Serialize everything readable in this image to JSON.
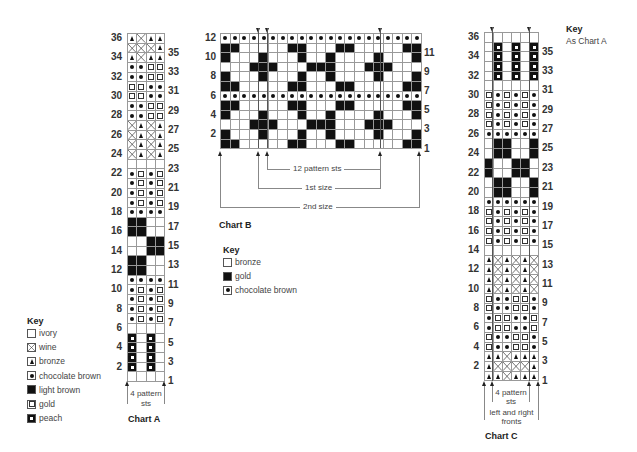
{
  "chart_a": {
    "title": "Chart A",
    "repeat_label": "4 pattern sts",
    "cols": 4,
    "rows_top_to_bottom": [
      [
        "T",
        "X",
        "T",
        "T"
      ],
      [
        "X",
        "X",
        "X",
        "T"
      ],
      [
        "T",
        "X",
        "T",
        "T"
      ],
      [
        "D",
        "D",
        "G",
        "G"
      ],
      [
        "D",
        "D",
        "G",
        "G"
      ],
      [
        "G",
        "G",
        "D",
        "D"
      ],
      [
        "G",
        "G",
        "D",
        "D"
      ],
      [
        "D",
        "D",
        "G",
        "G"
      ],
      [
        "D",
        "D",
        "G",
        "G"
      ],
      [
        "X",
        "T",
        "X",
        "T"
      ],
      [
        "X",
        "T",
        "X",
        "T"
      ],
      [
        "X",
        "T",
        "X",
        "T"
      ],
      [
        "X",
        "T",
        "X",
        "T"
      ],
      [
        "E",
        "E",
        "E",
        "E"
      ],
      [
        "D",
        "G",
        "D",
        "G"
      ],
      [
        "D",
        "G",
        "D",
        "G"
      ],
      [
        "D",
        "G",
        "D",
        "G"
      ],
      [
        "D",
        "G",
        "D",
        "G"
      ],
      [
        "D",
        "D",
        "D",
        "D"
      ],
      [
        "B",
        "B",
        "E",
        "E"
      ],
      [
        "B",
        "B",
        "E",
        "E"
      ],
      [
        "E",
        "E",
        "B",
        "B"
      ],
      [
        "E",
        "E",
        "B",
        "B"
      ],
      [
        "B",
        "B",
        "E",
        "E"
      ],
      [
        "B",
        "B",
        "E",
        "E"
      ],
      [
        "D",
        "D",
        "D",
        "D"
      ],
      [
        "D",
        "G",
        "D",
        "G"
      ],
      [
        "D",
        "G",
        "D",
        "G"
      ],
      [
        "D",
        "G",
        "D",
        "G"
      ],
      [
        "D",
        "G",
        "D",
        "G"
      ],
      [
        "E",
        "E",
        "E",
        "E"
      ],
      [
        "P",
        "E",
        "P",
        "E"
      ],
      [
        "P",
        "E",
        "P",
        "E"
      ],
      [
        "P",
        "E",
        "P",
        "E"
      ],
      [
        "P",
        "E",
        "P",
        "E"
      ],
      [
        "E",
        "E",
        "E",
        "E"
      ]
    ],
    "left_numbers": [
      "36",
      "34",
      "32",
      "30",
      "28",
      "26",
      "24",
      "22",
      "20",
      "18",
      "16",
      "14",
      "12",
      "10",
      "8",
      "6",
      "4",
      "2"
    ],
    "right_numbers": [
      "35",
      "33",
      "31",
      "29",
      "27",
      "25",
      "23",
      "21",
      "19",
      "17",
      "15",
      "13",
      "11",
      "9",
      "7",
      "5",
      "3",
      "1"
    ]
  },
  "key_a": {
    "title": "Key",
    "items": [
      {
        "symbol": "E",
        "label": "ivory"
      },
      {
        "symbol": "X",
        "label": "wine"
      },
      {
        "symbol": "T",
        "label": "bronze"
      },
      {
        "symbol": "D",
        "label": "chocolate brown"
      },
      {
        "symbol": "B",
        "label": "light brown"
      },
      {
        "symbol": "G",
        "label": "gold"
      },
      {
        "symbol": "P",
        "label": "peach"
      }
    ]
  },
  "chart_b": {
    "title": "Chart B",
    "cols": 21,
    "rows_top_to_bottom": [
      "DDDDDDDDDDDDDDDDDDDDD",
      "BBEEEEEBBEEEBBEEEEEBB",
      "BEEEBEEEBEEBEEEEBEEEB",
      "EEEBBBEEEBBBEEEBBBEEE",
      "BEEEBEEEBEEBEEEEBEEEB",
      "BBEEEEEBBEEEBBEEEEEBB",
      "DDDDDDDDDDDDDDDDDDDDD",
      "BBEEEEEBBEEEBBEEEEEBB",
      "BEEEBEEEBEEBEEEEBEEEB",
      "EEEBBBEEEBBBEEEBBBEEE",
      "BEEEBEEEBEEBEEEEBEEEB",
      "BBEEEEEBBEEEBBEEEEEBB"
    ],
    "left_numbers": [
      "12",
      "10",
      "8",
      "6",
      "4",
      "2"
    ],
    "right_numbers": [
      "11",
      "9",
      "7",
      "5",
      "3",
      "1"
    ],
    "brackets": [
      "12 pattern sts",
      "1st size",
      "2nd size"
    ]
  },
  "key_b": {
    "title": "Key",
    "items": [
      {
        "symbol": "E",
        "label": "bronze"
      },
      {
        "symbol": "B",
        "label": "gold"
      },
      {
        "symbol": "D",
        "label": "chocolate brown"
      }
    ]
  },
  "chart_c": {
    "title": "Chart C",
    "repeat_label": "4 pattern sts",
    "fronts_label": "left and right fronts",
    "cols": 6,
    "rows_top_to_bottom": [
      [
        "E",
        "E",
        "E",
        "E",
        "E",
        "E"
      ],
      [
        "E",
        "P",
        "E",
        "P",
        "E",
        "P"
      ],
      [
        "E",
        "P",
        "E",
        "P",
        "E",
        "P"
      ],
      [
        "E",
        "P",
        "E",
        "P",
        "E",
        "P"
      ],
      [
        "E",
        "P",
        "E",
        "P",
        "E",
        "P"
      ],
      [
        "E",
        "E",
        "E",
        "E",
        "E",
        "E"
      ],
      [
        "G",
        "D",
        "G",
        "D",
        "G",
        "D"
      ],
      [
        "G",
        "D",
        "G",
        "D",
        "G",
        "D"
      ],
      [
        "G",
        "D",
        "G",
        "D",
        "G",
        "D"
      ],
      [
        "G",
        "D",
        "G",
        "D",
        "G",
        "D"
      ],
      [
        "D",
        "D",
        "D",
        "D",
        "D",
        "D"
      ],
      [
        "E",
        "B",
        "B",
        "E",
        "E",
        "B"
      ],
      [
        "E",
        "B",
        "B",
        "E",
        "E",
        "B"
      ],
      [
        "B",
        "E",
        "E",
        "B",
        "B",
        "E"
      ],
      [
        "B",
        "E",
        "E",
        "B",
        "B",
        "E"
      ],
      [
        "E",
        "B",
        "B",
        "E",
        "E",
        "B"
      ],
      [
        "E",
        "B",
        "B",
        "E",
        "E",
        "B"
      ],
      [
        "D",
        "D",
        "D",
        "D",
        "D",
        "D"
      ],
      [
        "G",
        "D",
        "G",
        "D",
        "G",
        "D"
      ],
      [
        "G",
        "D",
        "G",
        "D",
        "G",
        "D"
      ],
      [
        "G",
        "D",
        "G",
        "D",
        "G",
        "D"
      ],
      [
        "G",
        "D",
        "G",
        "D",
        "G",
        "D"
      ],
      [
        "E",
        "E",
        "E",
        "E",
        "E",
        "E"
      ],
      [
        "T",
        "X",
        "T",
        "X",
        "T",
        "X"
      ],
      [
        "T",
        "X",
        "T",
        "X",
        "T",
        "X"
      ],
      [
        "T",
        "X",
        "T",
        "X",
        "T",
        "X"
      ],
      [
        "T",
        "X",
        "T",
        "X",
        "T",
        "X"
      ],
      [
        "G",
        "D",
        "D",
        "G",
        "G",
        "D"
      ],
      [
        "G",
        "D",
        "D",
        "G",
        "G",
        "D"
      ],
      [
        "D",
        "G",
        "G",
        "D",
        "D",
        "G"
      ],
      [
        "D",
        "G",
        "G",
        "D",
        "D",
        "G"
      ],
      [
        "G",
        "D",
        "D",
        "G",
        "G",
        "D"
      ],
      [
        "G",
        "D",
        "D",
        "G",
        "G",
        "D"
      ],
      [
        "T",
        "T",
        "X",
        "T",
        "T",
        "T"
      ],
      [
        "T",
        "X",
        "X",
        "X",
        "X",
        "T"
      ],
      [
        "T",
        "T",
        "X",
        "T",
        "T",
        "T"
      ]
    ],
    "left_numbers": [
      "36",
      "34",
      "32",
      "30",
      "28",
      "26",
      "24",
      "22",
      "20",
      "18",
      "16",
      "14",
      "12",
      "10",
      "8",
      "6",
      "4",
      "2"
    ],
    "right_numbers": [
      "35",
      "33",
      "31",
      "29",
      "27",
      "25",
      "23",
      "21",
      "19",
      "17",
      "15",
      "13",
      "11",
      "9",
      "7",
      "5",
      "3",
      "1"
    ]
  },
  "key_c": {
    "title": "Key",
    "note": "As Chart A"
  }
}
